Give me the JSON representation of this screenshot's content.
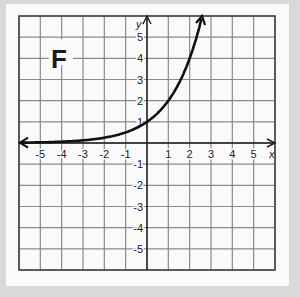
{
  "chart_data": {
    "type": "line",
    "title": "F",
    "xlabel": "x",
    "ylabel": "y",
    "xlim": [
      -6,
      6
    ],
    "ylim": [
      -6,
      6
    ],
    "grid": true,
    "x_ticks": [
      "-5",
      "-4",
      "-3",
      "-2",
      "-1",
      "1",
      "2",
      "3",
      "4",
      "5"
    ],
    "y_ticks": [
      "5",
      "4",
      "3",
      "2",
      "1",
      "-1",
      "-2",
      "-3",
      "-4",
      "-5"
    ],
    "series": [
      {
        "name": "y = 2^x",
        "x": [
          -6,
          -5,
          -4,
          -3,
          -2,
          -1,
          0,
          1,
          2,
          2.58
        ],
        "y": [
          0.016,
          0.031,
          0.063,
          0.125,
          0.25,
          0.5,
          1,
          2,
          4,
          6
        ]
      }
    ]
  },
  "labels": {
    "panel_letter": "F",
    "x_axis": "x",
    "y_axis": "y"
  },
  "colors": {
    "grid": "#8a8a8a",
    "axis": "#1a1a1a",
    "curve": "#111111",
    "frame_outer": "#d9d9d9",
    "frame_inner": "#fafafa"
  }
}
